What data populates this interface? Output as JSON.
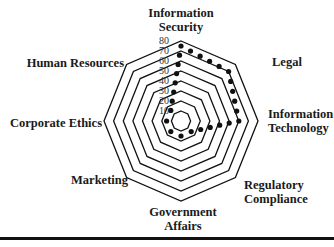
{
  "chart_data": {
    "type": "radar",
    "title": "",
    "categories": [
      "Information Security",
      "Legal",
      "Information Technology",
      "Regulatory Compliance",
      "Government Affairs",
      "Marketing",
      "Corporate Ethics",
      "Human Resources"
    ],
    "label_lines": [
      [
        "Information",
        "Security"
      ],
      [
        "Legal"
      ],
      [
        "Information",
        "Technology"
      ],
      [
        "Regulatory",
        "Compliance"
      ],
      [
        "Government",
        "Affairs"
      ],
      [
        "Marketing"
      ],
      [
        "Corporate Ethics"
      ],
      [
        "Human Resources"
      ]
    ],
    "radial_ticks": [
      10,
      20,
      30,
      40,
      50,
      60,
      70,
      80
    ],
    "rmin": 5,
    "rmax": 80,
    "series": [
      {
        "name": "",
        "values": [
          75,
          70,
          60,
          15,
          15,
          15,
          15,
          15
        ],
        "marker": "dot",
        "color": "#111111"
      }
    ],
    "grid": true,
    "legend": null
  },
  "colors": {
    "grid": "#111111",
    "marker": "#111111",
    "divider": "#111111"
  }
}
